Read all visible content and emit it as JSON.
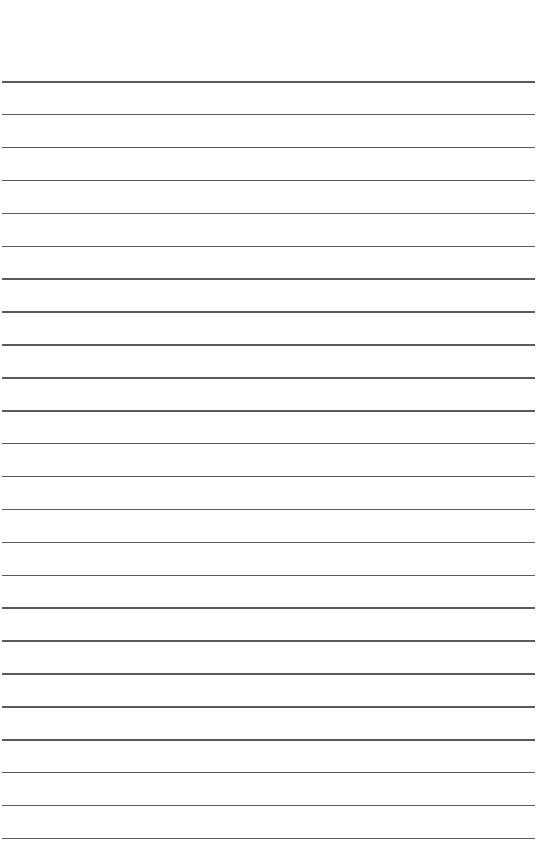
{
  "page": {
    "type": "ruled-lined-paper",
    "background_color": "#ffffff",
    "line_color": "#5a5a5a",
    "line_count": 24,
    "first_line_y": 81,
    "line_spacing": 32.9,
    "line_left": 2,
    "line_right": 535
  }
}
